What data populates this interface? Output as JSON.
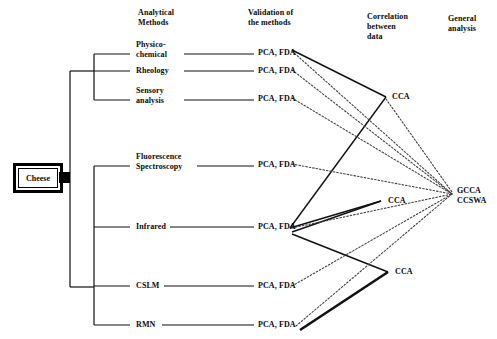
{
  "diagram": {
    "root": {
      "label": "Cheese",
      "x": 13,
      "y": 163
    },
    "columns": [
      {
        "id": "analytical-methods",
        "lines": [
          "Analytical",
          "Methods"
        ],
        "x": 138,
        "y": 8
      },
      {
        "id": "validation-of-methods",
        "lines": [
          "Validation of",
          "the methods"
        ],
        "x": 248,
        "y": 8
      },
      {
        "id": "correlation-between-data",
        "lines": [
          "Correlation",
          "between",
          "data"
        ],
        "x": 367,
        "y": 12
      },
      {
        "id": "general-analysis",
        "lines": [
          "General",
          "analysis"
        ],
        "x": 448,
        "y": 14
      }
    ],
    "methods": [
      {
        "id": "physico-chemical",
        "lines": [
          "Physico-",
          "chemical"
        ],
        "x": 136,
        "y": 40,
        "branch_y": 54,
        "validation": "PCA, FDA",
        "validation_x": 258,
        "validation_y": 48
      },
      {
        "id": "rheology",
        "lines": [
          "Rheology"
        ],
        "x": 136,
        "y": 66,
        "branch_y": 71,
        "validation": "PCA, FDA",
        "validation_x": 258,
        "validation_y": 67
      },
      {
        "id": "sensory-analysis",
        "lines": [
          "Sensory",
          "analysis"
        ],
        "x": 136,
        "y": 86,
        "branch_y": 100,
        "validation": "PCA, FDA",
        "validation_x": 258,
        "validation_y": 92
      },
      {
        "id": "fluorescence-spectroscopy",
        "lines": [
          "Fluorescence",
          "Spectroscopy"
        ],
        "x": 136,
        "y": 152,
        "branch_y": 166,
        "validation": "PCA, FDA",
        "validation_x": 258,
        "validation_y": 161
      },
      {
        "id": "infrared",
        "lines": [
          "Infrared"
        ],
        "x": 136,
        "y": 222,
        "branch_y": 227,
        "validation": "PCA, FDA",
        "validation_x": 258,
        "validation_y": 223
      },
      {
        "id": "cslm",
        "lines": [
          "CSLM"
        ],
        "x": 136,
        "y": 281,
        "branch_y": 286,
        "validation": "PCA, FDA",
        "validation_x": 258,
        "validation_y": 282
      },
      {
        "id": "rmn",
        "lines": [
          "RMN"
        ],
        "x": 136,
        "y": 320,
        "branch_y": 325,
        "validation": "PCA, FDA",
        "validation_x": 258,
        "validation_y": 321
      }
    ],
    "correlation_nodes": [
      {
        "id": "cca-top",
        "label": "CCA",
        "vertex_x": 386,
        "vertex_y": 97,
        "label_x": 392,
        "label_y": 93
      },
      {
        "id": "cca-middle",
        "label": "CCA",
        "vertex_x": 381,
        "vertex_y": 201,
        "label_x": 388,
        "label_y": 197
      },
      {
        "id": "cca-bottom",
        "label": "CCA",
        "vertex_x": 388,
        "vertex_y": 272,
        "label_x": 395,
        "label_y": 268
      }
    ],
    "general_node": {
      "id": "gcca-ccswa",
      "lines": [
        "GCCA",
        "CCSWA"
      ],
      "x": 457,
      "y": 186,
      "converge_x": 452,
      "converge_y": 194
    },
    "colors": {
      "stroke": "#111111",
      "text": "#0a0a0a",
      "background": "#ffffff"
    }
  }
}
